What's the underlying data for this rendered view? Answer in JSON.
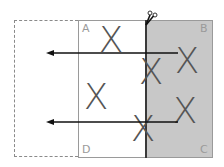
{
  "diagram": {
    "type": "paper-folding",
    "corners": {
      "a": "A",
      "b": "B",
      "c": "C",
      "d": "D"
    },
    "marks": [
      {
        "label": "X",
        "region": "A-side top"
      },
      {
        "label": "X",
        "region": "A-side middle"
      },
      {
        "label": "X",
        "region": "fold upper"
      },
      {
        "label": "X",
        "region": "fold lower"
      },
      {
        "label": "X",
        "region": "B-side upper"
      },
      {
        "label": "X",
        "region": "C-side lower"
      }
    ],
    "arrows": [
      {
        "direction": "left",
        "row": "upper"
      },
      {
        "direction": "left",
        "row": "lower"
      }
    ],
    "icons": {
      "scissors": "scissors-icon"
    },
    "colors": {
      "shaded_fill": "#c8c8c8",
      "border": "#9a9a9a",
      "fold_line": "#3a3a3a",
      "mark": "#555555",
      "arrow": "#111111"
    }
  }
}
